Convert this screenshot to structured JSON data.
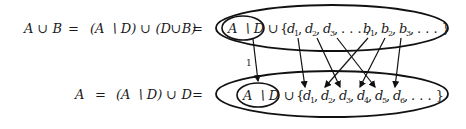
{
  "top_equation": {
    "lhs": "A ∪ B",
    "eq1": "=",
    "middle": "(A ∖ D) ∪ (D∪B)",
    "eq2": "=",
    "inner_set": "A ∖ D",
    "union": "∪",
    "elements": [
      "d1",
      "d2",
      "d3",
      "…",
      "b1",
      "b2",
      "b3",
      "…"
    ]
  },
  "bottom_equation": {
    "lhs": "A",
    "eq1": "=",
    "middle": "(A ∖ D) ∪ D",
    "eq2": "=",
    "inner_set": "A ∖ D",
    "union": "∪",
    "elements": [
      "d1",
      "d2",
      "d3",
      "d4",
      "d5",
      "d6",
      "…"
    ]
  },
  "mapping": {
    "identity_label": "1",
    "arrows": [
      {
        "from": "A∖D",
        "to": "A∖D"
      },
      {
        "from": "d1",
        "to": "d1"
      },
      {
        "from": "d2",
        "to": "d3"
      },
      {
        "from": "d3",
        "to": "d5"
      },
      {
        "from": "b1",
        "to": "d2"
      },
      {
        "from": "b2",
        "to": "d4"
      },
      {
        "from": "b3",
        "to": "d6"
      }
    ]
  }
}
